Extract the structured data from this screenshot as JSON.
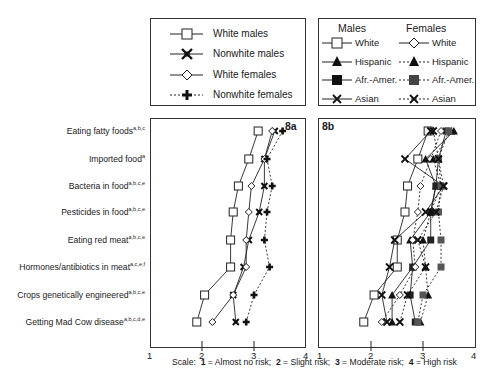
{
  "legend_a": {
    "items": [
      {
        "label": "White males",
        "marker": "square-open",
        "line": "solid"
      },
      {
        "label": "Nonwhite males",
        "marker": "star-filled",
        "line": "solid"
      },
      {
        "label": "White females",
        "marker": "diamond-open",
        "line": "solid"
      },
      {
        "label": "Nonwhite females",
        "marker": "plus-filled",
        "line": "dotted"
      }
    ]
  },
  "legend_b": {
    "males_header": "Males",
    "females_header": "Females",
    "males": [
      {
        "label": "White",
        "marker": "square-open"
      },
      {
        "label": "Hispanic",
        "marker": "triangle-filled"
      },
      {
        "label": "Afr.-Amer.",
        "marker": "square-filled"
      },
      {
        "label": "Asian",
        "marker": "x-cross"
      }
    ],
    "females": [
      {
        "label": "White",
        "marker": "diamond-open"
      },
      {
        "label": "Hispanic",
        "marker": "triangle-filled"
      },
      {
        "label": "Afr.-Amer.",
        "marker": "square-filled"
      },
      {
        "label": "Asian",
        "marker": "x-cross"
      }
    ]
  },
  "categories": [
    {
      "label": "Eating fatty foods",
      "sup": "a,b,c"
    },
    {
      "label": "Imported food",
      "sup": "a"
    },
    {
      "label": "Bacteria in food",
      "sup": "a,b,c,e"
    },
    {
      "label": "Pesticides in food",
      "sup": "a,b,c,e"
    },
    {
      "label": "Eating red meat",
      "sup": "a,b,c,e"
    },
    {
      "label": "Hormones/antibiotics in meat",
      "sup": "a,c,e,f"
    },
    {
      "label": "Crops genetically engineered",
      "sup": "a,b,c,e"
    },
    {
      "label": "Getting Mad Cow disease",
      "sup": "a,b,c,d,e"
    }
  ],
  "panel_a_label": "8a",
  "panel_b_label": "8b",
  "ticks": [
    "1",
    "2",
    "3",
    "4"
  ],
  "scale_note": {
    "prefix": "Scale:",
    "items": [
      {
        "num": "1",
        "text": "= Almost no risk;"
      },
      {
        "num": "2",
        "text": "= Slight risk;"
      },
      {
        "num": "3",
        "text": "= Moderate risk;"
      },
      {
        "num": "4",
        "text": "= High risk"
      }
    ]
  },
  "chart_data": [
    {
      "type": "line",
      "title": "8a",
      "orientation": "horizontal",
      "categories": [
        "Eating fatty foods",
        "Imported food",
        "Bacteria in food",
        "Pesticides in food",
        "Eating red meat",
        "Hormones/antibiotics in meat",
        "Crops genetically engineered",
        "Getting Mad Cow disease"
      ],
      "xlabel": "Scale: 1 = Almost no risk; 2 = Slight risk; 3 = Moderate risk; 4 = High risk",
      "xlim": [
        1,
        4
      ],
      "series": [
        {
          "name": "White males",
          "values": [
            3.08,
            2.9,
            2.7,
            2.6,
            2.55,
            2.55,
            2.05,
            1.9
          ]
        },
        {
          "name": "Nonwhite males",
          "values": [
            3.4,
            3.2,
            3.2,
            3.1,
            2.9,
            2.8,
            2.6,
            2.65
          ]
        },
        {
          "name": "White females",
          "values": [
            3.35,
            3.2,
            2.95,
            2.9,
            2.85,
            2.85,
            2.6,
            2.2
          ]
        },
        {
          "name": "Nonwhite females",
          "values": [
            3.55,
            3.25,
            3.35,
            3.25,
            3.2,
            3.3,
            3.0,
            2.85
          ]
        }
      ]
    },
    {
      "type": "line",
      "title": "8b",
      "orientation": "horizontal",
      "categories": [
        "Eating fatty foods",
        "Imported food",
        "Bacteria in food",
        "Pesticides in food",
        "Eating red meat",
        "Hormones/antibiotics in meat",
        "Crops genetically engineered",
        "Getting Mad Cow disease"
      ],
      "xlabel": "Scale: 1 = Almost no risk; 2 = Slight risk; 3 = Moderate risk; 4 = High risk",
      "xlim": [
        1,
        4
      ],
      "series": [
        {
          "name": "Males White",
          "values": [
            3.1,
            2.9,
            2.7,
            2.65,
            2.5,
            2.5,
            2.05,
            1.85
          ]
        },
        {
          "name": "Males Hispanic",
          "values": [
            3.6,
            3.05,
            3.25,
            3.15,
            2.75,
            2.8,
            2.4,
            2.4
          ]
        },
        {
          "name": "Males Afr.-Amer.",
          "values": [
            3.45,
            3.3,
            3.25,
            3.15,
            3.15,
            2.8,
            2.75,
            2.85
          ]
        },
        {
          "name": "Males Asian",
          "values": [
            3.15,
            2.65,
            3.4,
            3.05,
            2.45,
            2.35,
            2.2,
            2.3
          ]
        },
        {
          "name": "Females White",
          "values": [
            3.35,
            3.15,
            2.95,
            2.9,
            2.8,
            2.85,
            2.55,
            2.2
          ]
        },
        {
          "name": "Females Hispanic",
          "values": [
            3.55,
            3.2,
            3.35,
            3.15,
            3.0,
            3.05,
            3.1,
            2.95
          ]
        },
        {
          "name": "Females Afr.-Amer.",
          "values": [
            3.5,
            3.3,
            3.35,
            3.3,
            3.35,
            3.35,
            3.0,
            2.9
          ]
        },
        {
          "name": "Females Asian",
          "values": [
            3.2,
            3.3,
            3.4,
            3.25,
            2.9,
            3.05,
            2.7,
            2.55
          ]
        }
      ]
    }
  ]
}
